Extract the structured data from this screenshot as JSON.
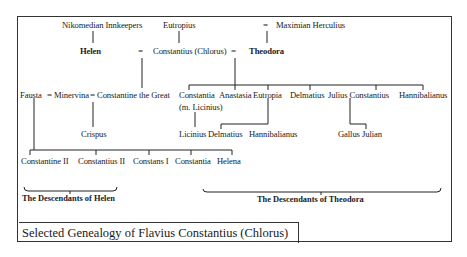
{
  "caption": "Selected Genealogy of Flavius Constantius (Chlorus)",
  "generation_1": {
    "nikomedian_innkeepers": "Nikomedian Innkeepers",
    "eutropius": "Eutropius",
    "maximian_marriage_sign": "=",
    "maximian": "Maximian Herculius"
  },
  "generation_2": {
    "helen": "Helen",
    "marriage_sign_1": "=",
    "constantius": "Constantius (Chlorus)",
    "marriage_sign_2": "=",
    "theodora": "Theodora"
  },
  "generation_3": {
    "fausta": "Fausta",
    "eq_a": "=",
    "minervina": "Minervina",
    "eq_b": "=",
    "constantine": "Constantine the Great",
    "theodora_children": [
      {
        "name": "Constantia",
        "note": "(m. Licinius)"
      },
      {
        "name": "Anastasia"
      },
      {
        "name": "Eutropia"
      },
      {
        "name": "Delmatius"
      },
      {
        "name": "Julius Constantius"
      },
      {
        "name": "Hannibalianus"
      }
    ]
  },
  "generation_4": {
    "crispus": "Crispus",
    "licinius": "Licinius",
    "delmatius_children": [
      "Delmatius",
      "Hannibalianus"
    ],
    "julius_constantius_children": [
      "Gallus",
      "Julian"
    ]
  },
  "generation_5": {
    "fausta_children": [
      "Constantine II",
      "Constantius II",
      "Constans I",
      "Constantia",
      "Helena"
    ]
  },
  "brackets": {
    "helen_label": "The Descendants of Helen",
    "theodora_label": "The Descendants of Theodora"
  }
}
